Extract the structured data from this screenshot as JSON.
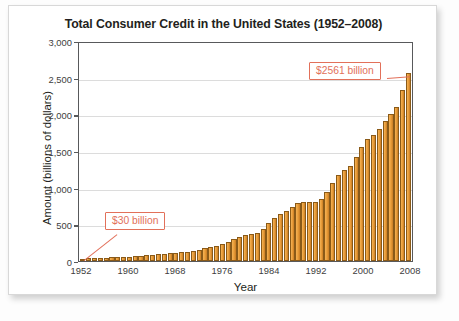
{
  "card": {
    "title": "Total Consumer Credit in the United States (1952–2008)"
  },
  "annotations": {
    "high": "$2561 billion",
    "low": "$30 billion"
  },
  "colors": {
    "bar_light": "#f3b256",
    "bar_dark": "#c87c25",
    "bar_outline": "#8a5a18",
    "callout": "#e2705a",
    "axis": "#58595b",
    "gridline": "#dcdcdc",
    "title_text": "#231f20"
  },
  "chart_data": {
    "type": "bar",
    "title": "Total Consumer Credit in the United States (1952–2008)",
    "xlabel": "Year",
    "ylabel": "Amount (billions of dollars)",
    "ylim": [
      0,
      3000
    ],
    "yticks": [
      0,
      500,
      1000,
      1500,
      2000,
      2500,
      3000
    ],
    "ytick_labels": [
      "0",
      "500",
      "1,000",
      "1,500",
      "2,000",
      "2,500",
      "3,000"
    ],
    "xticks": [
      1952,
      1960,
      1968,
      1976,
      1984,
      1992,
      2000,
      2008
    ],
    "xtick_labels": [
      "1952",
      "1960",
      "1968",
      "1976",
      "1984",
      "1992",
      "2000",
      "2008"
    ],
    "grid": "horizontal",
    "legend": "none",
    "categories": [
      1952,
      1953,
      1954,
      1955,
      1956,
      1957,
      1958,
      1959,
      1960,
      1961,
      1962,
      1963,
      1964,
      1965,
      1966,
      1967,
      1968,
      1969,
      1970,
      1971,
      1972,
      1973,
      1974,
      1975,
      1976,
      1977,
      1978,
      1979,
      1980,
      1981,
      1982,
      1983,
      1984,
      1985,
      1986,
      1987,
      1988,
      1989,
      1990,
      1991,
      1992,
      1993,
      1994,
      1995,
      1996,
      1997,
      1998,
      1999,
      2000,
      2001,
      2002,
      2003,
      2004,
      2005,
      2006,
      2007,
      2008
    ],
    "values": [
      30,
      35,
      36,
      43,
      45,
      48,
      48,
      55,
      60,
      62,
      68,
      76,
      85,
      96,
      101,
      106,
      114,
      123,
      127,
      137,
      157,
      180,
      190,
      201,
      226,
      257,
      298,
      332,
      350,
      366,
      384,
      431,
      512,
      593,
      646,
      686,
      731,
      795,
      808,
      800,
      805,
      840,
      942,
      1067,
      1168,
      1236,
      1300,
      1418,
      1556,
      1665,
      1723,
      1802,
      1904,
      2009,
      2101,
      2326,
      2561
    ],
    "value_labels": {
      "1952": "$30 billion",
      "2008": "$2561 billion"
    }
  }
}
